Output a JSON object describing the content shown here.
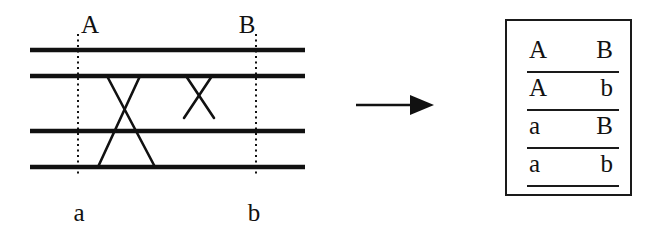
{
  "figure": {
    "background_color": "#ffffff",
    "ink_color": "#111111"
  },
  "diagram": {
    "title_label": "crossing-over diagram",
    "locus_labels": {
      "top_left": "A",
      "top_right": "B",
      "bottom_left": "a",
      "bottom_right": "b"
    },
    "chromatid_lines": {
      "count": 4,
      "y_positions": [
        50,
        76,
        131,
        167
      ],
      "x_start": 30,
      "x_end": 305,
      "stroke_width": 4,
      "color": "#111111"
    },
    "locus_guides": [
      {
        "name": "locus-A-a",
        "x": 78,
        "y_start": 34,
        "y_end": 176,
        "style": "dotted"
      },
      {
        "name": "locus-B-b",
        "x": 256,
        "y_start": 34,
        "y_end": 176,
        "style": "dotted"
      }
    ],
    "crossovers": [
      {
        "name": "crossover-chromatids-2-4",
        "description": "long crossing between the second and fourth chromatids",
        "segments": [
          {
            "x1": 107,
            "y1": 76,
            "x2": 155,
            "y2": 167
          },
          {
            "x1": 140,
            "y1": 76,
            "x2": 98,
            "y2": 167
          }
        ]
      },
      {
        "name": "crossover-chromatids-2-3",
        "description": "short crossing just right of centre between the second and third chromatids",
        "segments": [
          {
            "x1": 186,
            "y1": 76,
            "x2": 214,
            "y2": 118
          },
          {
            "x1": 212,
            "y1": 76,
            "x2": 184,
            "y2": 118
          }
        ]
      }
    ]
  },
  "arrow": {
    "name": "rightward arrow",
    "direction": "right",
    "color": "#111111"
  },
  "gamete_table": {
    "border_color": "#1a1a1a",
    "column_headers": [
      "first locus",
      "second locus"
    ],
    "rows": [
      {
        "left": "A",
        "right": "B"
      },
      {
        "left": "A",
        "right": "b"
      },
      {
        "left": "a",
        "right": "B"
      },
      {
        "left": "a",
        "right": "b"
      }
    ]
  }
}
